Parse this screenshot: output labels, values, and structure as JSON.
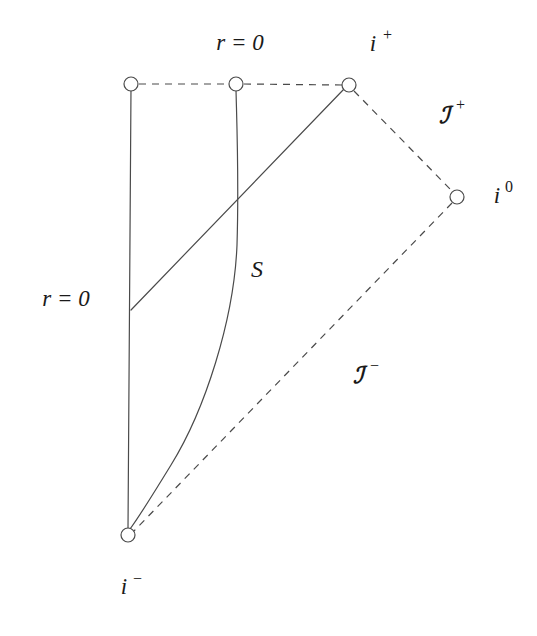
{
  "figure": {
    "canvas": {
      "width": 537,
      "height": 636,
      "background": "#ffffff"
    },
    "stroke_color": "#4a4a4a",
    "text_color": "#1a1a1a",
    "stroke_width": 1.2,
    "dash_pattern": "7,6"
  },
  "labels": {
    "r_zero_top": "r = 0",
    "r_zero_left": "r = 0",
    "i_plus": "i",
    "i_plus_sup": "+",
    "i_zero": "i",
    "i_zero_sup": "0",
    "i_minus": "i",
    "i_minus_sup": "−",
    "scri_plus": "ℐ",
    "scri_plus_sup": "+",
    "scri_minus": "ℐ",
    "scri_minus_sup": "−",
    "surface_S": "S"
  },
  "label_positions": {
    "r_zero_top": {
      "x": 240,
      "y": 45
    },
    "r_zero_left": {
      "x": 66,
      "y": 301
    },
    "i_plus": {
      "x": 373,
      "y": 46
    },
    "i_zero": {
      "x": 497,
      "y": 198
    },
    "i_minus": {
      "x": 124,
      "y": 589
    },
    "scri_plus": {
      "x": 444,
      "y": 116
    },
    "scri_minus": {
      "x": 358,
      "y": 376
    },
    "surface_S": {
      "x": 257,
      "y": 271
    }
  },
  "nodes": [
    {
      "name": "node-top-left-r0",
      "x": 131,
      "y": 84,
      "radius": 7
    },
    {
      "name": "node-top-middle-r0",
      "x": 236,
      "y": 84,
      "radius": 7
    },
    {
      "name": "node-i-plus",
      "x": 349,
      "y": 85,
      "radius": 7
    },
    {
      "name": "node-i-zero",
      "x": 457,
      "y": 197,
      "radius": 7
    },
    {
      "name": "node-i-minus",
      "x": 128,
      "y": 535,
      "radius": 7
    }
  ],
  "edges": {
    "solid": [
      {
        "name": "left-vertical-r0-axis",
        "x1": 131,
        "y1": 88,
        "x2": 128,
        "y2": 529
      },
      {
        "name": "diagonal-null-ray",
        "x1": 131,
        "y1": 310,
        "x2": 344,
        "y2": 89
      }
    ],
    "dashed": [
      {
        "name": "top-dashed-left-segment",
        "x1": 139,
        "y1": 84,
        "x2": 229,
        "y2": 84
      },
      {
        "name": "top-dashed-right-segment",
        "x1": 244,
        "y1": 84,
        "x2": 342,
        "y2": 85
      },
      {
        "name": "scri-plus-edge",
        "x1": 354,
        "y1": 91,
        "x2": 452,
        "y2": 191
      },
      {
        "name": "scri-minus-edge",
        "x1": 452,
        "y1": 203,
        "x2": 134,
        "y2": 531
      }
    ],
    "curves": [
      {
        "name": "curve-S-surface",
        "path": "M 236 90 C 237 130 239 180 237 245 C 234 320 205 410 171 465 C 152 496 136 521 130 529"
      }
    ]
  }
}
